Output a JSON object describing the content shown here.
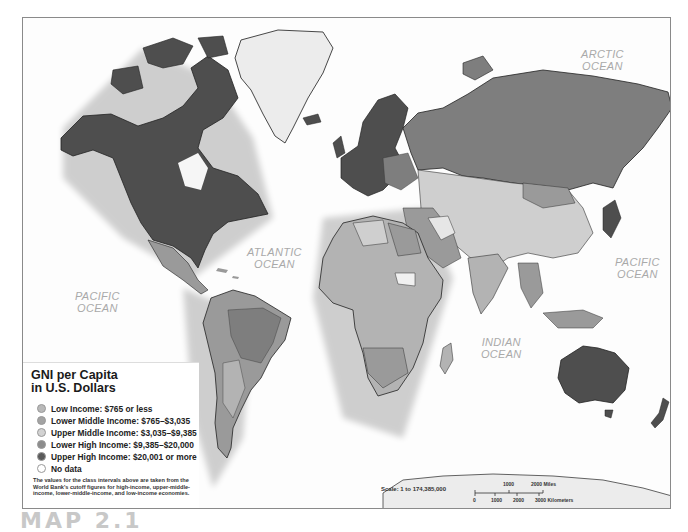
{
  "map": {
    "title": "GNI per Capita in U.S. Dollars",
    "oceans": [
      {
        "id": "arctic",
        "line1": "ARCTIC",
        "line2": "OCEAN"
      },
      {
        "id": "atlantic",
        "line1": "ATLANTIC",
        "line2": "OCEAN"
      },
      {
        "id": "pacific-west",
        "line1": "PACIFIC",
        "line2": "OCEAN"
      },
      {
        "id": "pacific-east",
        "line1": "PACIFIC",
        "line2": "OCEAN"
      },
      {
        "id": "indian",
        "line1": "INDIAN",
        "line2": "OCEAN"
      }
    ],
    "scale_label": "Scale: 1 to 174,385,000",
    "scale_bar": {
      "miles": [
        "1000",
        "2000 Miles"
      ],
      "km": [
        "0",
        "1000",
        "2000",
        "3000 Kilometers"
      ]
    }
  },
  "legend": {
    "title_line1": "GNI per Capita",
    "title_line2": "in U.S. Dollars",
    "items": [
      {
        "label": "Low Income: $765 or less",
        "color": "#b9b9b9"
      },
      {
        "label": "Lower Middle Income: $765–$3,035",
        "color": "#a3a3a3"
      },
      {
        "label": "Upper Middle Income: $3,035–$9,385",
        "color": "#d2d2d2"
      },
      {
        "label": "Lower High Income: $9,385–$20,000",
        "color": "#8c8c8c"
      },
      {
        "label": "Upper High Income: $20,001 or more",
        "color": "#5a5a5a"
      },
      {
        "label": "No data",
        "color": "#ffffff"
      }
    ],
    "note": "The values for the class intervals above are taken from the World Bank's cutoff figures for high-income, upper-middle-income, lower-middle-income, and low-income economies."
  },
  "caption": "MAP 2.1",
  "colors": {
    "upper_high": "#4e4e4e",
    "lower_high": "#7e7e7e",
    "upper_middle": "#cfcfcf",
    "lower_middle": "#9a9a9a",
    "low": "#b3b3b3",
    "greenland": "#ececec",
    "border": "#2a2a2a"
  }
}
